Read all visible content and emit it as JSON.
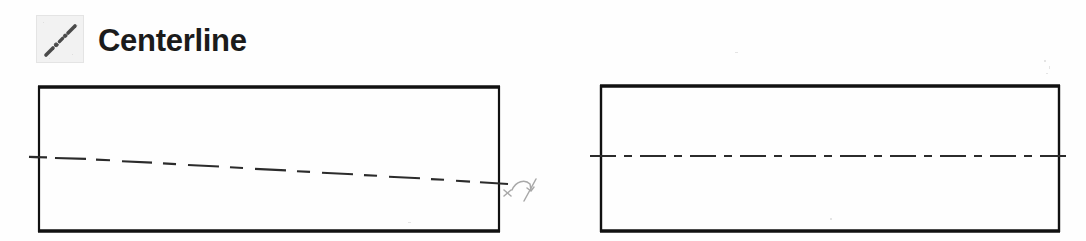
{
  "figure": {
    "title": "Centerline",
    "kind": "technical-drawing-line-type-example",
    "background_color": "#fefefe"
  },
  "legend": {
    "label": "Centerline",
    "label_color": "#1b1b1b",
    "swatch": {
      "icon_name": "centerline-dash-dot-icon",
      "background_color": "#f2f2f2",
      "border_color": "#e4e4e4",
      "stroke_color": "#4a4a4a",
      "pattern": "dash-dot-dash diagonal"
    }
  },
  "drawing": {
    "stroke_color": "#111111",
    "centerline_color": "#2b2b2b",
    "annotation_color": "#a8a8a8",
    "left_view": {
      "name": "hand-drawn-centerline-example",
      "rect": {
        "x": 38,
        "y": 86,
        "width": 462,
        "height": 146
      },
      "centerline": {
        "style": "hand-drawn dashed, sloping downward",
        "start": {
          "x": 30,
          "y": 157
        },
        "end": {
          "x": 508,
          "y": 184
        }
      },
      "annotation": {
        "name": "handwritten-correction-mark",
        "glyph": "x-curved-arrow-slash",
        "x": 503,
        "y": 172
      }
    },
    "right_view": {
      "name": "standard-centerline-example",
      "rect": {
        "x": 600,
        "y": 85,
        "width": 460,
        "height": 147
      },
      "centerline": {
        "style": "long-dash short-dash (dash-dot)",
        "start": {
          "x": 590,
          "y": 156
        },
        "end": {
          "x": 1070,
          "y": 156
        }
      }
    }
  }
}
